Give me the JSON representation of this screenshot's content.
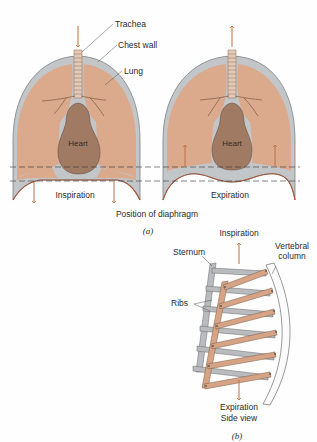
{
  "figure_a": {
    "labels": {
      "trachea": "Trachea",
      "chest_wall": "Chest wall",
      "lung": "Lung",
      "heart_left": "Heart",
      "heart_right": "Heart",
      "inspiration": "Inspiration",
      "expiration": "Expiration",
      "position_of_diaphragm": "Position of diaphragm",
      "caption": "(a)"
    }
  },
  "figure_b": {
    "labels": {
      "inspiration": "Inspiration",
      "sternum": "Sternum",
      "vertebral_1": "Vertebral",
      "vertebral_2": "column",
      "ribs": "Ribs",
      "expiration": "Expiration",
      "side_view": "Side view",
      "caption": "(b)"
    }
  },
  "colors": {
    "lung": "#dba98c",
    "heart": "#a07a62",
    "pleura": "#c3c6c9",
    "arrow": "#c0703e",
    "rib_tan": "#d6a485",
    "rib_gray": "#b9bbbe"
  }
}
